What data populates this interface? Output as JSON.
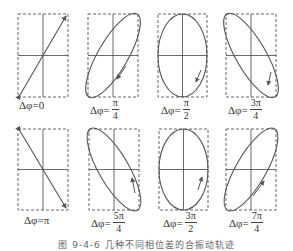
{
  "figure": {
    "caption": "图 9-4-6  几种不同相位差的合振动轨迹",
    "colors": {
      "stroke": "#555555",
      "dash": "#666666",
      "axis": "#444444"
    },
    "panels": [
      {
        "id": "p0",
        "prefix": "Δφ=",
        "value": "0",
        "shape": "line-up"
      },
      {
        "id": "p1",
        "prefix": "Δφ=",
        "num": "π",
        "den": "4",
        "shape": "ellipse-right"
      },
      {
        "id": "p2",
        "prefix": "Δφ=",
        "num": "π",
        "den": "2",
        "shape": "ellipse-vertical"
      },
      {
        "id": "p3",
        "prefix": "Δφ=",
        "num": "3π",
        "den": "4",
        "shape": "ellipse-left"
      },
      {
        "id": "p4",
        "prefix": "Δφ=",
        "value": "π",
        "shape": "line-down"
      },
      {
        "id": "p5",
        "prefix": "Δφ=",
        "num": "5π",
        "den": "4",
        "shape": "ellipse-left"
      },
      {
        "id": "p6",
        "prefix": "Δφ=",
        "num": "3π",
        "den": "2",
        "shape": "ellipse-vertical"
      },
      {
        "id": "p7",
        "prefix": "Δφ=",
        "num": "7π",
        "den": "4",
        "shape": "ellipse-right"
      }
    ]
  }
}
